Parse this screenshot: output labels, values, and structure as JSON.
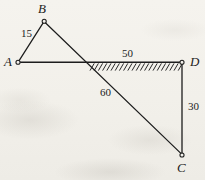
{
  "figure": {
    "background_color": "#f3f1ec",
    "ink_color": "#1d1d1d",
    "width": 205,
    "height": 180,
    "nodes": [
      {
        "id": "A",
        "label": "A",
        "x": 18,
        "y": 62,
        "label_x": 4,
        "label_y": 55,
        "marker": "open-circle"
      },
      {
        "id": "B",
        "label": "B",
        "x": 44,
        "y": 21,
        "label_x": 38,
        "label_y": 2,
        "marker": "open-circle"
      },
      {
        "id": "C",
        "label": "C",
        "x": 182,
        "y": 155,
        "label_x": 177,
        "label_y": 162,
        "marker": "open-circle"
      },
      {
        "id": "D",
        "label": "D",
        "x": 182,
        "y": 62,
        "label_x": 190,
        "label_y": 55,
        "marker": "open-circle"
      }
    ],
    "members": [
      {
        "id": "AB",
        "from": "A",
        "to": "B",
        "length_label": "15",
        "label_x": 21,
        "label_y": 28
      },
      {
        "id": "BC",
        "from": "B",
        "to": "C",
        "length_label": "60",
        "label_x": 100,
        "label_y": 87
      },
      {
        "id": "AD",
        "from": "A",
        "to": "D",
        "length_label": "50",
        "label_x": 122,
        "label_y": 48
      },
      {
        "id": "CD",
        "from": "C",
        "to": "D",
        "length_label": "30",
        "label_x": 188,
        "label_y": 101
      }
    ],
    "support": {
      "type": "hatched-ground",
      "along_member": "AD",
      "x_start": 90,
      "x_end": 182,
      "y": 63,
      "hatch_count": 22,
      "hatch_length": 8,
      "hatch_lean": "right"
    }
  }
}
